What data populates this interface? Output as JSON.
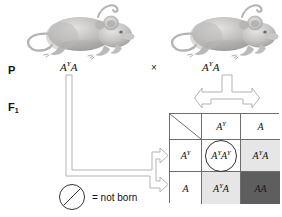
{
  "figure": {
    "generations": [
      {
        "id": "p",
        "label": "P",
        "subscript": ""
      },
      {
        "id": "f1",
        "label": "F",
        "subscript": "1"
      }
    ],
    "cross_symbol": "×",
    "parents": [
      {
        "side": "left",
        "organism": "mouse",
        "allele1": "A",
        "allele1_sup": "Y",
        "allele2": "A",
        "genotype_plain": "A^Y A"
      },
      {
        "side": "right",
        "organism": "mouse",
        "allele1": "A",
        "allele1_sup": "Y",
        "allele2": "A",
        "genotype_plain": "A^Y A"
      }
    ],
    "punnett": {
      "corner": "",
      "column_headers": [
        {
          "allele": "A",
          "sup": "Y"
        },
        {
          "allele": "A",
          "sup": ""
        }
      ],
      "row_headers": [
        {
          "allele": "A",
          "sup": "Y"
        },
        {
          "allele": "A",
          "sup": ""
        }
      ],
      "cells": [
        {
          "row": 0,
          "col": 0,
          "allele1": "A",
          "allele1_sup": "Y",
          "allele2": "A",
          "allele2_sup": "Y",
          "genotype_plain": "A^Y A^Y",
          "shade": "none",
          "circled": true,
          "status": "not born"
        },
        {
          "row": 0,
          "col": 1,
          "allele1": "A",
          "allele1_sup": "Y",
          "allele2": "A",
          "allele2_sup": "",
          "genotype_plain": "A^Y A",
          "shade": "light",
          "circled": false,
          "status": ""
        },
        {
          "row": 1,
          "col": 0,
          "allele1": "A",
          "allele1_sup": "Y",
          "allele2": "A",
          "allele2_sup": "",
          "genotype_plain": "A^Y A",
          "shade": "light",
          "circled": false,
          "status": ""
        },
        {
          "row": 1,
          "col": 1,
          "allele1": "A",
          "allele1_sup": "",
          "allele2": "A",
          "allele2_sup": "",
          "genotype_plain": "AA",
          "shade": "dark",
          "circled": false,
          "status": ""
        }
      ]
    },
    "legend": {
      "symbol": "circle-slash",
      "text": "= not born"
    },
    "colors": {
      "shade_light": "#e6e6e6",
      "shade_dark": "#5e5e5e",
      "grid_line": "#6e6e6e",
      "arrow_outline": "#9a9a9a",
      "text": "#111111"
    }
  }
}
